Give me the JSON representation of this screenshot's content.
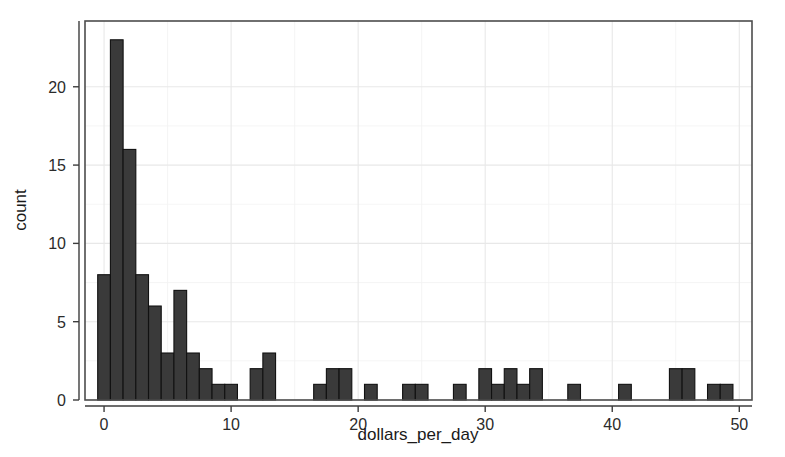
{
  "chart_data": {
    "type": "bar",
    "title": "",
    "subtitle": "",
    "xlabel": "dollars_per_day",
    "ylabel": "count",
    "xlim": [
      -1.5,
      51
    ],
    "ylim": [
      0,
      24.2
    ],
    "xticks": [
      0,
      10,
      20,
      30,
      40,
      50
    ],
    "xtick_labels": [
      "0",
      "10",
      "20",
      "30",
      "40",
      "50"
    ],
    "yticks": [
      0,
      5,
      10,
      15,
      20
    ],
    "ytick_labels": [
      "0",
      "5",
      "10",
      "15",
      "20"
    ],
    "grid": true,
    "grid_major_color": "#e8e8e8",
    "bar_fill": "#3a3a3a",
    "bar_stroke": "#111111",
    "legend": null,
    "binwidth": 1,
    "bin_starts": [
      -0.5,
      0.5,
      1.5,
      2.5,
      3.5,
      4.5,
      5.5,
      6.5,
      7.5,
      8.5,
      9.5,
      10.5,
      11.5,
      12.5,
      13.5,
      14.5,
      15.5,
      16.5,
      17.5,
      18.5,
      19.5,
      20.5,
      21.5,
      22.5,
      23.5,
      24.5,
      25.5,
      26.5,
      27.5,
      28.5,
      29.5,
      30.5,
      31.5,
      32.5,
      33.5,
      34.5,
      35.5,
      36.5,
      37.5,
      38.5,
      39.5,
      40.5,
      41.5,
      42.5,
      43.5,
      44.5,
      45.5,
      46.5,
      47.5,
      48.5
    ],
    "categories": [
      0,
      1,
      2,
      3,
      4,
      5,
      6,
      7,
      8,
      9,
      10,
      11,
      12,
      13,
      14,
      15,
      16,
      17,
      18,
      19,
      20,
      21,
      22,
      23,
      24,
      25,
      26,
      27,
      28,
      29,
      30,
      31,
      32,
      33,
      34,
      35,
      36,
      37,
      38,
      39,
      40,
      41,
      42,
      43,
      44,
      45,
      46,
      47,
      48,
      49
    ],
    "values": [
      8,
      23,
      16,
      8,
      6,
      3,
      7,
      3,
      2,
      1,
      1,
      0,
      2,
      3,
      0,
      0,
      0,
      1,
      2,
      2,
      0,
      1,
      0,
      0,
      1,
      1,
      0,
      0,
      1,
      0,
      2,
      1,
      2,
      1,
      2,
      0,
      0,
      1,
      0,
      0,
      0,
      1,
      0,
      0,
      0,
      2,
      2,
      0,
      1,
      1
    ]
  }
}
